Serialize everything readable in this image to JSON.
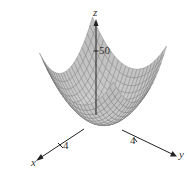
{
  "chart_data": {
    "type": "surface3d",
    "title": "",
    "function": "z = x^2 + y^2",
    "x_range": [
      -5,
      5
    ],
    "y_range": [
      -5,
      5
    ],
    "grid_lines": 20,
    "axes": {
      "x": {
        "label": "x",
        "ticks": [
          {
            "value": 4,
            "label": "4"
          }
        ]
      },
      "y": {
        "label": "y",
        "ticks": [
          {
            "value": 4,
            "label": "4"
          }
        ]
      },
      "z": {
        "label": "z",
        "ticks": [
          {
            "value": 50,
            "label": "50"
          }
        ]
      }
    },
    "colors": {
      "surface": "#c8c8c8",
      "mesh": "#6e6e6e",
      "axis": "#222222"
    }
  }
}
